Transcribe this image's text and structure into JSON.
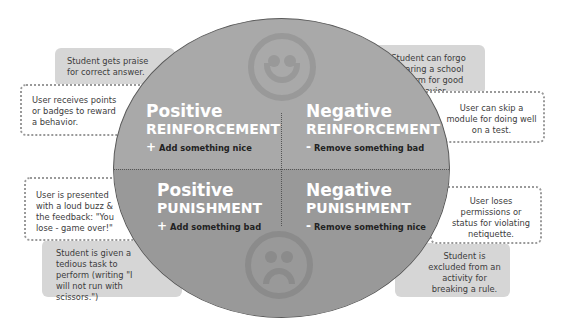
{
  "examples": {
    "pos_reinf_student": "Student gets praise for correct answer.",
    "pos_reinf_user": "User receives points or badges to reward a behavior.",
    "neg_reinf_student": "Student can forgo wearing a school uniform for good behavior.",
    "neg_reinf_user": "User can skip a module for doing well on a test.",
    "pos_pun_user": "User is presented with a loud buzz & the feedback: \"You lose - game over!\"",
    "pos_pun_student": "Student is given a tedious task to perform (writing \"I will not run with scissors.\")",
    "neg_pun_user": "User loses permissions or status for violating netiquette.",
    "neg_pun_student": "Student is excluded from an activity for breaking a rule."
  },
  "quadrants": {
    "pos_reinf": {
      "title": "Positive",
      "subtitle": "REINFORCEMENT",
      "sign": "+",
      "action": "Add something nice"
    },
    "neg_reinf": {
      "title": "Negative",
      "subtitle": "REINFORCEMENT",
      "sign": "-",
      "action": "Remove something bad"
    },
    "pos_pun": {
      "title": "Positive",
      "subtitle": "PUNISHMENT",
      "sign": "+",
      "action": "Add something bad"
    },
    "neg_pun": {
      "title": "Negative",
      "subtitle": "PUNISHMENT",
      "sign": "-",
      "action": "Remove something nice"
    }
  },
  "icons": {
    "top": "smiley-face-icon",
    "bottom": "sad-face-icon"
  },
  "colors": {
    "upper_half": "#a9a9a9",
    "lower_half": "#999999",
    "gray_box": "#d6d6d6"
  }
}
